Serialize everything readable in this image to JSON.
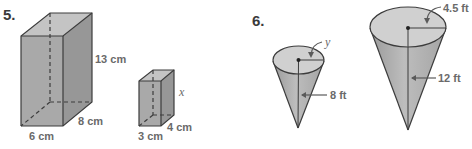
{
  "problems": [
    {
      "number": "5.",
      "figure_type": "similar rectangular prisms",
      "large_prism": {
        "height_label": "13 cm",
        "depth_label": "8 cm",
        "width_label": "6 cm"
      },
      "small_prism": {
        "height_label": "x",
        "depth_label": "4 cm",
        "width_label": "3 cm"
      }
    },
    {
      "number": "6.",
      "figure_type": "similar cones",
      "small_cone": {
        "radius_label": "y",
        "height_label": "8 ft"
      },
      "large_cone": {
        "radius_label": "4.5 ft",
        "height_label": "12 ft"
      }
    }
  ],
  "colors": {
    "front_face": "#a9a9a9",
    "top_face": "#c4c4c4",
    "side_face": "#979797",
    "cone_body": "#b0b0b0",
    "cone_top": "#d0d0d0",
    "edge": "#3c3c3c",
    "label": "#6a6a6a"
  }
}
